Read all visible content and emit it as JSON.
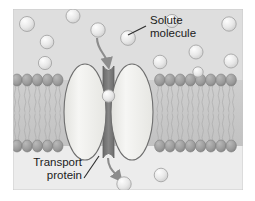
{
  "figure": {
    "panel": {
      "x": 13,
      "y": 9,
      "width": 230,
      "height": 181
    },
    "colors": {
      "page_background": "#ffffff",
      "extracellular_background": "#dedede",
      "cytoplasm_background": "#ececec",
      "lipid_head": "#9c9c9c",
      "lipid_head_dark": "#8a8a8a",
      "lipid_tail": "#c9c9c9",
      "protein_fill": "#f2f2f0",
      "protein_outline": "#6e6e6e",
      "channel_fill": "#767676",
      "solute_fill": "#e4e4e4",
      "solute_outline": "#a6a6a6",
      "arrow_color": "#8c8c8c",
      "label_color": "#1b1b1b",
      "leader_color": "#2b2b2b"
    }
  },
  "labels": [
    {
      "id": "solute-molecule",
      "line1": "Solute",
      "line2": "molecule",
      "text_x": 150,
      "text_y": 24,
      "anchor": "start",
      "leader": {
        "x1": 146,
        "y1": 26,
        "x2": 128,
        "y2": 35
      }
    },
    {
      "id": "transport-protein",
      "line1": "Transport",
      "line2": "protein",
      "text_x": 82,
      "text_y": 166,
      "anchor": "end",
      "leader": {
        "x1": 84,
        "y1": 178,
        "x2": 99,
        "y2": 156
      }
    }
  ],
  "membrane": {
    "name": "phospholipid-bilayer",
    "top_head_y": 80,
    "bottom_head_y": 146,
    "head_radius_x": 5.2,
    "head_radius_y": 6.0,
    "leaflet_gap_y": 113,
    "spacing": 10.2,
    "left_edge": 13,
    "right_edge": 243
  },
  "transport_protein": {
    "name": "transport-protein",
    "left_lobe": {
      "cx": 85,
      "cy": 112,
      "rx": 21,
      "ry": 48
    },
    "right_lobe": {
      "cx": 132,
      "cy": 112,
      "rx": 21,
      "ry": 48
    },
    "channel": {
      "x": 103,
      "y": 66,
      "width": 11,
      "height": 92
    }
  },
  "solutes_extracellular": [
    {
      "cx": 27,
      "cy": 24,
      "r": 7.5
    },
    {
      "cx": 73,
      "cy": 16,
      "r": 7.0
    },
    {
      "cx": 98,
      "cy": 30,
      "r": 7.2
    },
    {
      "cx": 47,
      "cy": 42,
      "r": 6.8
    },
    {
      "cx": 128,
      "cy": 38,
      "r": 7.4
    },
    {
      "cx": 172,
      "cy": 21,
      "r": 6.6
    },
    {
      "cx": 229,
      "cy": 24,
      "r": 7.2
    },
    {
      "cx": 196,
      "cy": 52,
      "r": 7.0
    },
    {
      "cx": 160,
      "cy": 62,
      "r": 6.8
    },
    {
      "cx": 45,
      "cy": 63,
      "r": 6.6
    },
    {
      "cx": 231,
      "cy": 61,
      "r": 7.0
    },
    {
      "cx": 198,
      "cy": 72,
      "r": 5.2
    }
  ],
  "solute_in_channel": {
    "cx": 108.5,
    "cy": 96,
    "r": 6.2
  },
  "solutes_cytoplasm": [
    {
      "cx": 124,
      "cy": 184,
      "r": 7.2
    },
    {
      "cx": 161,
      "cy": 175,
      "r": 6.8
    }
  ],
  "arrows": [
    {
      "id": "arrow-solute-entering",
      "path": "M 97 38 C 97 50, 106 54, 108 64"
    },
    {
      "id": "arrow-solute-exiting",
      "path": "M 108 158 C 108 168, 114 172, 119 178"
    }
  ],
  "icons": {
    "solute_sphere": "sphere-icon",
    "lipid_head": "circle-head-icon",
    "lipid_tail": "wavy-tail-icon",
    "arrow_head": "arrow-head-icon"
  }
}
